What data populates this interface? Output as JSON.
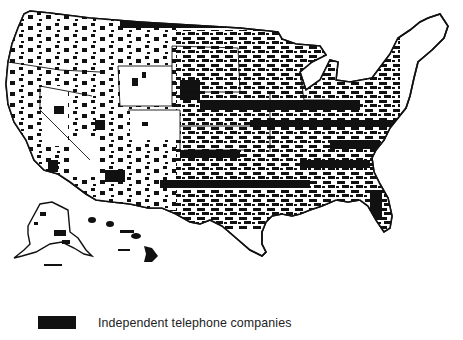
{
  "map": {
    "subject": "United States (contiguous states, Alaska, Hawaii)",
    "fill_color": "#111111",
    "background_color": "#ffffff",
    "regions_shown": [
      "contiguous-us",
      "alaska",
      "hawaii"
    ]
  },
  "legend": {
    "items": [
      {
        "label": "Independent telephone companies",
        "color": "#111111"
      }
    ]
  }
}
